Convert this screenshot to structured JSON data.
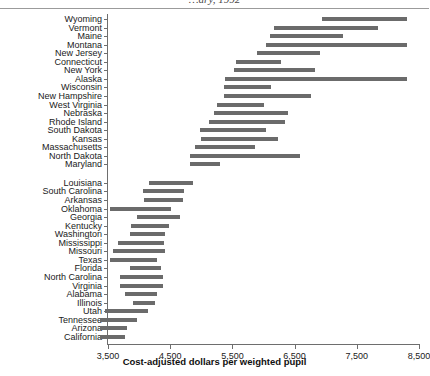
{
  "figure": {
    "title_partial": "…ary, 1992",
    "accent_bar": "#6b6b6b",
    "axis_color": "#6e6e6e"
  },
  "chart_data": {
    "type": "bar",
    "orientation": "horizontal",
    "style": "range / floating bars (min-max interval per state)",
    "title": "",
    "xlabel": "Cost-adjusted dollars per weighted pupil",
    "ylabel": "",
    "xlim": [
      3500,
      8500
    ],
    "xticks": [
      3500,
      4500,
      5500,
      6500,
      7500,
      8500
    ],
    "xticklabels": [
      "3,500",
      "4,500",
      "5,500",
      "6,500",
      "7,500",
      "8,500"
    ],
    "grid": false,
    "legend": null,
    "group_gap_after_index": 17,
    "categories": [
      "Wyoming",
      "Vermont",
      "Maine",
      "Montana",
      "New Jersey",
      "Connecticut",
      "New York",
      "Alaska",
      "Wisconsin",
      "New Hampshire",
      "West Virginia",
      "Nebraska",
      "Rhode Island",
      "South Dakota",
      "Kansas",
      "Massachusetts",
      "North Dakota",
      "Maryland",
      "Louisiana",
      "South Carolina",
      "Arkansas",
      "Oklahoma",
      "Georgia",
      "Kentucky",
      "Washington",
      "Mississippi",
      "Missouri",
      "Texas",
      "Florida",
      "North Carolina",
      "Virginia",
      "Alabama",
      "Illinois",
      "Utah",
      "Tennessee",
      "Arizona",
      "California"
    ],
    "ranges": [
      {
        "state": "Wyoming",
        "low": 6940,
        "high": 8310
      },
      {
        "state": "Vermont",
        "low": 6170,
        "high": 7840
      },
      {
        "state": "Maine",
        "low": 6100,
        "high": 7280
      },
      {
        "state": "Montana",
        "low": 6040,
        "high": 8310
      },
      {
        "state": "New Jersey",
        "low": 5900,
        "high": 6910
      },
      {
        "state": "Connecticut",
        "low": 5560,
        "high": 6280
      },
      {
        "state": "New York",
        "low": 5530,
        "high": 6830
      },
      {
        "state": "Alaska",
        "low": 5380,
        "high": 8310
      },
      {
        "state": "Wisconsin",
        "low": 5370,
        "high": 6120
      },
      {
        "state": "New Hampshire",
        "low": 5370,
        "high": 6760
      },
      {
        "state": "West Virginia",
        "low": 5250,
        "high": 6010
      },
      {
        "state": "Nebraska",
        "low": 5200,
        "high": 6390
      },
      {
        "state": "Rhode Island",
        "low": 5120,
        "high": 6340
      },
      {
        "state": "South Dakota",
        "low": 4980,
        "high": 6040
      },
      {
        "state": "Kansas",
        "low": 4990,
        "high": 6230
      },
      {
        "state": "Massachusetts",
        "low": 4900,
        "high": 5860
      },
      {
        "state": "North Dakota",
        "low": 4820,
        "high": 6590
      },
      {
        "state": "Maryland",
        "low": 4820,
        "high": 5300
      },
      {
        "state": "Louisiana",
        "low": 4160,
        "high": 4870
      },
      {
        "state": "South Carolina",
        "low": 4060,
        "high": 4720
      },
      {
        "state": "Arkansas",
        "low": 4080,
        "high": 4710
      },
      {
        "state": "Oklahoma",
        "low": 3530,
        "high": 4510
      },
      {
        "state": "Georgia",
        "low": 3970,
        "high": 4660
      },
      {
        "state": "Kentucky",
        "low": 3870,
        "high": 4480
      },
      {
        "state": "Washington",
        "low": 3850,
        "high": 4420
      },
      {
        "state": "Mississippi",
        "low": 3660,
        "high": 4400
      },
      {
        "state": "Missouri",
        "low": 3580,
        "high": 4420
      },
      {
        "state": "Texas",
        "low": 3530,
        "high": 4290
      },
      {
        "state": "Florida",
        "low": 3850,
        "high": 4350
      },
      {
        "state": "North Carolina",
        "low": 3700,
        "high": 4380
      },
      {
        "state": "Virginia",
        "low": 3690,
        "high": 4380
      },
      {
        "state": "Alabama",
        "low": 3770,
        "high": 4290
      },
      {
        "state": "Illinois",
        "low": 3900,
        "high": 4260
      },
      {
        "state": "Utah",
        "low": 3450,
        "high": 4140
      },
      {
        "state": "Tennessee",
        "low": 3370,
        "high": 3970
      },
      {
        "state": "Arizona",
        "low": 3370,
        "high": 3810
      },
      {
        "state": "California",
        "low": 3370,
        "high": 3770
      }
    ]
  }
}
